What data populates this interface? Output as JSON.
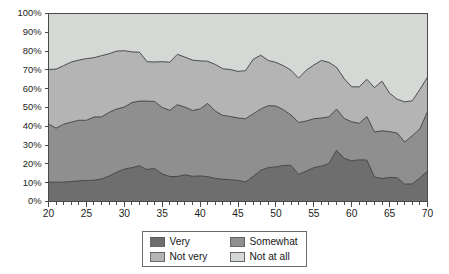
{
  "chart_data": {
    "type": "area",
    "stacked": true,
    "stack_mode": "percent",
    "title": "",
    "subtitle": "",
    "xlabel": "",
    "ylabel": "",
    "xlim": [
      20,
      70
    ],
    "ylim": [
      0,
      100
    ],
    "grid": false,
    "legend_position": "bottom",
    "y_tick_labels": [
      "0%",
      "10%",
      "20%",
      "30%",
      "40%",
      "50%",
      "60%",
      "70%",
      "80%",
      "90%",
      "100%"
    ],
    "y_tick_values": [
      0,
      10,
      20,
      30,
      40,
      50,
      60,
      70,
      80,
      90,
      100
    ],
    "x_tick_labels": [
      "20",
      "25",
      "30",
      "35",
      "40",
      "45",
      "50",
      "55",
      "60",
      "65",
      "70"
    ],
    "x_tick_values": [
      20,
      25,
      30,
      35,
      40,
      45,
      50,
      55,
      60,
      65,
      70
    ],
    "x_minor_tick_step": 1,
    "x": [
      20,
      21,
      22,
      23,
      24,
      25,
      26,
      27,
      28,
      29,
      30,
      31,
      32,
      33,
      34,
      35,
      36,
      37,
      38,
      39,
      40,
      41,
      42,
      43,
      44,
      45,
      46,
      47,
      48,
      49,
      50,
      51,
      52,
      53,
      54,
      55,
      56,
      57,
      58,
      59,
      60,
      61,
      62,
      63,
      64,
      65,
      66,
      67,
      68,
      69,
      70
    ],
    "series": [
      {
        "name": "Very",
        "color": "#6e6e6e",
        "values": [
          10.4,
          10.2,
          10.3,
          10.6,
          11.0,
          11.2,
          11.3,
          12.0,
          13.6,
          15.6,
          17.2,
          18.0,
          19.0,
          17.0,
          17.6,
          14.6,
          13.3,
          13.3,
          14.2,
          13.4,
          13.6,
          13.2,
          12.3,
          11.8,
          11.6,
          11.2,
          10.4,
          13.4,
          16.6,
          18.0,
          18.4,
          19.2,
          19.2,
          14.4,
          16.2,
          18.0,
          18.8,
          20.2,
          27.2,
          23.0,
          21.6,
          22.2,
          22.0,
          13.0,
          12.2,
          12.8,
          12.6,
          9.2,
          9.4,
          12.6,
          16.2
        ]
      },
      {
        "name": "Somewhat",
        "color": "#8f8f8f",
        "values": [
          30.8,
          28.8,
          30.8,
          31.6,
          32.2,
          32.0,
          33.6,
          33.0,
          33.8,
          33.6,
          33.0,
          34.6,
          34.4,
          36.4,
          35.6,
          35.4,
          35.2,
          38.2,
          36.0,
          35.0,
          35.6,
          39.0,
          35.8,
          34.0,
          33.6,
          33.2,
          33.6,
          33.2,
          32.6,
          33.0,
          32.4,
          29.6,
          26.8,
          27.6,
          26.6,
          26.0,
          25.6,
          24.8,
          22.0,
          21.2,
          20.8,
          19.4,
          23.2,
          24.0,
          25.4,
          24.4,
          23.8,
          22.4,
          25.6,
          26.0,
          31.6
        ]
      },
      {
        "name": "Not very",
        "color": "#b4b4b4",
        "values": [
          29.0,
          31.4,
          31.2,
          32.0,
          32.0,
          32.8,
          31.6,
          32.6,
          31.2,
          30.8,
          30.0,
          27.0,
          26.0,
          21.0,
          21.0,
          24.4,
          25.6,
          26.8,
          26.6,
          26.8,
          25.6,
          22.4,
          24.8,
          24.8,
          25.0,
          24.8,
          25.6,
          29.0,
          28.6,
          24.0,
          23.2,
          23.4,
          23.8,
          23.6,
          27.0,
          28.6,
          30.6,
          29.0,
          22.2,
          21.2,
          18.6,
          19.4,
          19.8,
          23.6,
          26.4,
          20.4,
          18.0,
          21.4,
          18.6,
          21.0,
          18.4
        ]
      },
      {
        "name": "Not at all",
        "color": "#d5d9d6",
        "values": [
          29.8,
          29.6,
          27.7,
          25.8,
          24.8,
          24.0,
          23.5,
          22.4,
          21.4,
          20.0,
          19.8,
          20.4,
          20.6,
          25.6,
          25.8,
          25.6,
          25.9,
          21.7,
          23.2,
          24.8,
          25.2,
          25.4,
          27.1,
          29.4,
          29.8,
          30.8,
          30.4,
          24.4,
          22.2,
          25.0,
          26.0,
          27.8,
          30.2,
          34.4,
          30.2,
          27.4,
          25.0,
          26.0,
          28.6,
          34.6,
          39.0,
          39.0,
          35.0,
          39.4,
          36.0,
          42.4,
          45.6,
          47.0,
          46.4,
          40.4,
          33.8
        ]
      }
    ]
  },
  "legend": {
    "entries": [
      {
        "label": "Very",
        "color": "#6e6e6e"
      },
      {
        "label": "Somewhat",
        "color": "#8f8f8f"
      },
      {
        "label": "Not very",
        "color": "#b4b4b4"
      },
      {
        "label": "Not at all",
        "color": "#d5d9d6"
      }
    ]
  },
  "colors": {
    "very": "#6e6e6e",
    "somewhat": "#8f8f8f",
    "not_very": "#b4b4b4",
    "not_at_all": "#d5d9d6",
    "axis": "#4a4a4a",
    "outline": "#3a3a3a",
    "text": "#1d1d1d",
    "background": "#ffffff"
  }
}
